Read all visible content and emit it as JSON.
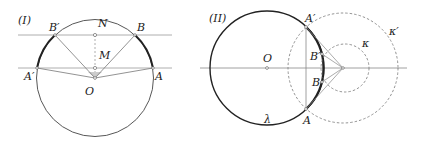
{
  "panel_I": {
    "title": "(I)",
    "labels": {
      "B_prime": "B′",
      "N": "N",
      "B": "B",
      "M": "M",
      "A_prime": "A′",
      "A": "A",
      "O": "O"
    }
  },
  "panel_II": {
    "title": "(II)",
    "labels": {
      "A_prime": "A′",
      "O": "O",
      "B_prime": "B′",
      "B": "B",
      "A": "A",
      "kappa": "κ",
      "kappa_prime": "κ′",
      "lambda": "λ"
    }
  },
  "colors": {
    "line": "#888888",
    "thick": "#222222",
    "dashed": "#777777"
  }
}
